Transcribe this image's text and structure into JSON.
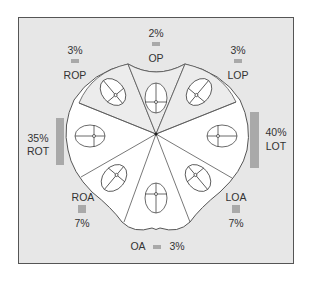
{
  "colors": {
    "frame_bg": "#e7e7e7",
    "frame_border": "#555555",
    "shape_fill": "#ffffff",
    "posterior_fill": "#ececec",
    "bar": "#a9a9a9",
    "line": "#555555"
  },
  "positions": [
    {
      "code": "OP",
      "label": "OP",
      "percent": "2%",
      "value": 2
    },
    {
      "code": "LOP",
      "label": "LOP",
      "percent": "3%",
      "value": 3
    },
    {
      "code": "LOT",
      "label": "LOT",
      "percent": "40%",
      "value": 40
    },
    {
      "code": "LOA",
      "label": "LOA",
      "percent": "7%",
      "value": 7
    },
    {
      "code": "OA",
      "label": "OA",
      "percent": "3%",
      "value": 3
    },
    {
      "code": "ROA",
      "label": "ROA",
      "percent": "7%",
      "value": 7
    },
    {
      "code": "ROT",
      "label": "ROT",
      "percent": "35%",
      "value": 35
    },
    {
      "code": "ROP",
      "label": "ROP",
      "percent": "3%",
      "value": 3
    }
  ]
}
